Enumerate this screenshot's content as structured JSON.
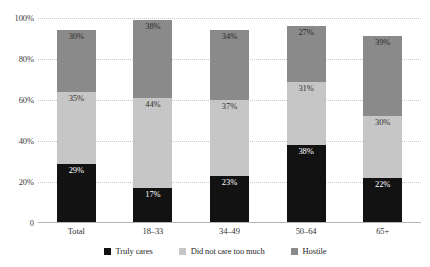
{
  "chart_data": {
    "type": "bar",
    "title": "",
    "xlabel": "",
    "ylabel": "",
    "stacked": true,
    "stack_mode": "percent",
    "grid": true,
    "legend_position": "bottom",
    "ylim": [
      0,
      100
    ],
    "yticks": [
      "0",
      "20%",
      "40%",
      "60%",
      "80%",
      "100%"
    ],
    "ytick_values": [
      0,
      20,
      40,
      60,
      80,
      100
    ],
    "categories": [
      "Total",
      "18–33",
      "34–49",
      "50–64",
      "65+"
    ],
    "series": [
      {
        "name": "Truly cares",
        "color": "#121212",
        "values": [
          29,
          17,
          23,
          38,
          22
        ],
        "labels": [
          "29%",
          "17%",
          "23%",
          "38%",
          "22%"
        ]
      },
      {
        "name": "Did not care too much",
        "color": "#c6c6c6",
        "values": [
          35,
          44,
          37,
          31,
          30
        ],
        "labels": [
          "35%",
          "44%",
          "37%",
          "31%",
          "30%"
        ]
      },
      {
        "name": "Hostile",
        "color": "#8a8a8a",
        "values": [
          30,
          38,
          34,
          27,
          39
        ],
        "labels": [
          "30%",
          "38%",
          "34%",
          "27%",
          "39%"
        ]
      }
    ]
  },
  "colors": {
    "background": "#ffffff",
    "gridline": "#c8c8c8",
    "axis": "#b4b4b4",
    "text": "#333333"
  }
}
